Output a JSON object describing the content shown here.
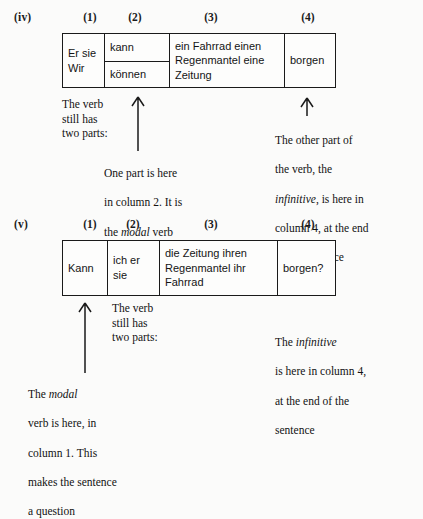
{
  "page": {
    "background_color": "#fbfbfa",
    "ink_color": "#141414"
  },
  "examples": [
    {
      "roman_label": "(iv)",
      "column_headers": [
        "(1)",
        "(2)",
        "(3)",
        "(4)"
      ],
      "table": {
        "col1": "Er\nsie\nWir",
        "col2_top": "kann",
        "col2_bottom": "können",
        "col3": "ein Fahrrad\neinen Regenmantel\neine Zeitung",
        "col4": "borgen"
      },
      "notes": {
        "left_top": "The verb\nstill has\ntwo parts:",
        "left_detail_line1": "One part is here",
        "left_detail_line2": "in column 2. It is",
        "left_detail_line3_pre": "the ",
        "left_detail_line3_em": "modal",
        "left_detail_line3_post": " verb",
        "right_line1": "The other part of",
        "right_line2": "the verb, the",
        "right_line3_em": "infinitive",
        "right_line3_post": ", is here in",
        "right_line4": "column 4, at the end",
        "right_line5": "of the sentence"
      }
    },
    {
      "roman_label": "(v)",
      "column_headers": [
        "(1)",
        "(2)",
        "(3)",
        "(4)"
      ],
      "table": {
        "col1": "Kann",
        "col2": "ich\ner\nsie",
        "col3": "die Zeitung\nihren Regenmantel\nihr Fahrrad",
        "col4": "borgen?"
      },
      "notes": {
        "middle_top": "The verb\nstill has\ntwo parts:",
        "bottom_left_line1_pre": "The ",
        "bottom_left_line1_em": "modal",
        "bottom_left_line2": "verb is here, in",
        "bottom_left_line3": "column 1. This",
        "bottom_left_line4": "makes the sentence",
        "bottom_left_line5": "a question",
        "right_line1_pre": "The ",
        "right_line1_em": "infinitive",
        "right_line2": "is here in column 4,",
        "right_line3": "at the end of the",
        "right_line4": "sentence"
      }
    }
  ],
  "icons": {
    "arrow_up": "arrow-up-icon"
  }
}
